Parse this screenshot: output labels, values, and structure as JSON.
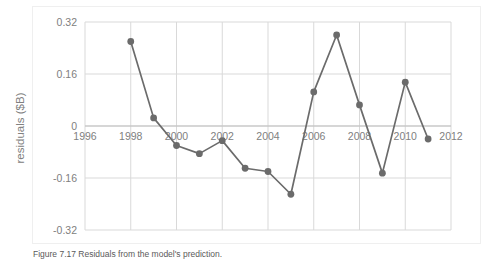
{
  "figure": {
    "caption": "Figure 7.17 Residuals from the model's prediction."
  },
  "chart_data": {
    "type": "line",
    "title": "",
    "xlabel": "",
    "ylabel": "residuals ($B)",
    "x": [
      1998,
      1999,
      2000,
      2001,
      2002,
      2003,
      2004,
      2005,
      2006,
      2007,
      2008,
      2009,
      2010,
      2011
    ],
    "values": [
      0.26,
      0.025,
      -0.06,
      -0.085,
      -0.045,
      -0.13,
      -0.14,
      -0.21,
      0.105,
      0.28,
      0.065,
      -0.145,
      0.135,
      -0.04
    ],
    "series": [
      {
        "name": "residuals",
        "values": [
          0.26,
          0.025,
          -0.06,
          -0.085,
          -0.045,
          -0.13,
          -0.14,
          -0.21,
          0.105,
          0.28,
          0.065,
          -0.145,
          0.135,
          -0.04
        ]
      }
    ],
    "xlim": [
      1996,
      2012
    ],
    "ylim": [
      -0.32,
      0.32
    ],
    "xticks": [
      1996,
      1998,
      2000,
      2002,
      2004,
      2006,
      2008,
      2010,
      2012
    ],
    "xtick_labels": [
      "1996",
      "1998",
      "2000",
      "2002",
      "2004",
      "2006",
      "2008",
      "2010",
      "2012"
    ],
    "yticks": [
      0.32,
      0.16,
      0,
      -0.16,
      -0.32
    ],
    "ytick_labels": [
      "0.32",
      "0.16",
      "0",
      "-0.16",
      "-0.32"
    ],
    "grid": true,
    "legend": false,
    "legend_position": "none",
    "marker": "circle",
    "line_color": "#6b6b6b",
    "marker_color": "#6b6b6b",
    "grid_color": "#d9d9d9",
    "zero_line_color": "#bfbfbf",
    "background": "#ffffff",
    "annotations": []
  }
}
